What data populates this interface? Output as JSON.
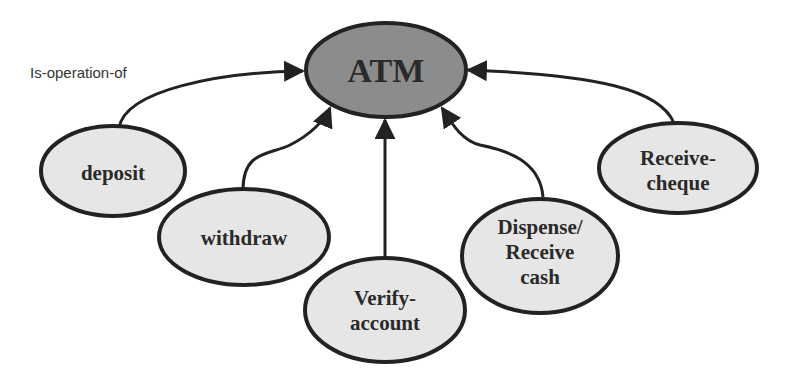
{
  "diagram": {
    "edge_label": "Is-operation-of",
    "center": {
      "label": "ATM",
      "fill": "#8c8c8c"
    },
    "nodes": [
      {
        "id": "deposit",
        "lines": [
          "deposit"
        ]
      },
      {
        "id": "withdraw",
        "lines": [
          "withdraw"
        ]
      },
      {
        "id": "verify-account",
        "lines": [
          "Verify-",
          "account"
        ]
      },
      {
        "id": "dispense-receive-cash",
        "lines": [
          "Dispense/",
          "Receive",
          "cash"
        ]
      },
      {
        "id": "receive-cheque",
        "lines": [
          "Receive-",
          "cheque"
        ]
      }
    ],
    "node_fill": "#e6e6e6",
    "stroke": "#222222"
  }
}
